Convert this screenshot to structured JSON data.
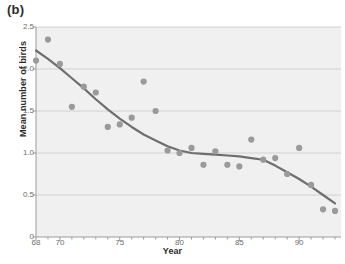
{
  "panel": {
    "label": "(b)"
  },
  "chart_data": {
    "type": "scatter",
    "title": "",
    "subtitle": "",
    "xlabel": "Year",
    "ylabel": "Mean number of birds",
    "xlim": [
      68,
      93.5
    ],
    "ylim": [
      0,
      2.5
    ],
    "grid": true,
    "legend": null,
    "x_tick_labels": [
      "68",
      "70",
      "75",
      "80",
      "85",
      "90"
    ],
    "x_tick_values": [
      68,
      70,
      75,
      80,
      85,
      90
    ],
    "x_minor_tick_values": [
      68,
      69,
      70,
      71,
      72,
      73,
      74,
      75,
      76,
      77,
      78,
      79,
      80,
      81,
      82,
      83,
      84,
      85,
      86,
      87,
      88,
      89,
      90,
      91,
      92,
      93
    ],
    "y_tick_labels": [
      "0",
      "0.5",
      "1.0",
      "1.5",
      "2.0",
      "2.5"
    ],
    "y_tick_values": [
      0,
      0.5,
      1.0,
      1.5,
      2.0,
      2.5
    ],
    "colors": {
      "plot_background": "#f0f0f0",
      "gridline": "#c9c9c9",
      "marker": "#9a9a9a",
      "trend_line": "#6e6e6e",
      "axis": "#9b9b9b",
      "text": "#6d6d6d"
    },
    "series": [
      {
        "name": "Mean number of birds",
        "marker": "circle",
        "x": [
          68,
          69,
          70,
          71,
          72,
          73,
          74,
          75,
          76,
          77,
          78,
          79,
          80,
          81,
          82,
          83,
          84,
          85,
          86,
          87,
          88,
          89,
          90,
          91,
          92,
          93
        ],
        "values": [
          2.1,
          2.35,
          2.06,
          1.55,
          1.79,
          1.72,
          1.31,
          1.34,
          1.42,
          1.85,
          1.5,
          1.03,
          1.0,
          1.06,
          0.86,
          1.02,
          0.86,
          0.84,
          1.16,
          0.92,
          0.94,
          0.75,
          1.06,
          0.62,
          0.33,
          0.31
        ]
      }
    ],
    "trend": {
      "name": "smoothed trend",
      "x": [
        68,
        69,
        70,
        71,
        72,
        73,
        74,
        75,
        76,
        77,
        78,
        79,
        80,
        81,
        82,
        83,
        84,
        85,
        86,
        87,
        88,
        89,
        90,
        91,
        92,
        93
      ],
      "values": [
        2.22,
        2.12,
        2.01,
        1.89,
        1.77,
        1.64,
        1.52,
        1.41,
        1.31,
        1.22,
        1.15,
        1.08,
        1.03,
        1.0,
        0.99,
        0.98,
        0.97,
        0.96,
        0.94,
        0.92,
        0.85,
        0.77,
        0.69,
        0.6,
        0.5,
        0.4
      ]
    }
  }
}
